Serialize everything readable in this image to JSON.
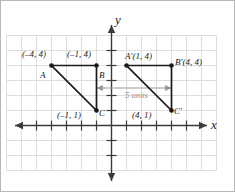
{
  "figure": {
    "background_color": "#ffffff",
    "border_color": "#b9b9b9",
    "grid_color": "#dcdcdc",
    "axis_color": "#3a3a3a",
    "shape_color": "#1a1a1a",
    "measure_color": "#8f8f8f"
  },
  "axes": {
    "x_label": "x",
    "y_label": "y",
    "x_arrow_left": true,
    "x_arrow_right": true,
    "y_arrow_up": true,
    "y_arrow_down": true
  },
  "grid": {
    "spacing_px": 15,
    "x_min": -7,
    "x_max": 7,
    "y_min": -5,
    "y_max": 6
  },
  "shapes": [
    {
      "name": "triangle-abc",
      "vertices": [
        {
          "name": "A",
          "label": "A",
          "coord_label": "(–4, 4)",
          "x": -4,
          "y": 4
        },
        {
          "name": "B",
          "label": "B",
          "coord_label": "(–1, 4)",
          "x": -1,
          "y": 4
        },
        {
          "name": "C",
          "label": "C",
          "coord_label": "(–1, 1)",
          "x": -1,
          "y": 1
        }
      ]
    },
    {
      "name": "triangle-a-prime-b-prime-c-prime",
      "vertices": [
        {
          "name": "A-prime",
          "label": "Aʹ",
          "coord_label": "(1, 4)",
          "x": 1,
          "y": 4
        },
        {
          "name": "B-prime",
          "label": "Bʹ",
          "coord_label": "(4, 4)",
          "x": 4,
          "y": 4
        },
        {
          "name": "C-prime",
          "label": "Cʹ",
          "coord_label": "(4, 1)",
          "x": 4,
          "y": 1
        }
      ]
    }
  ],
  "annotation": {
    "measure_label": "5 units",
    "from_x": -1,
    "to_x": 4,
    "at_y": 2.5
  },
  "labels": {
    "a_coord": "(–4, 4)",
    "a_name": "A",
    "b_coord": "(–1, 4)",
    "b_name": "B",
    "c_coord": "(–1, 1)",
    "c_name": "C",
    "ap_name_coord": "Aʹ(1, 4)",
    "bp_name_coord": "Bʹ(4, 4)",
    "cp_coord": "(4, 1)",
    "cp_name": "Cʹ"
  }
}
